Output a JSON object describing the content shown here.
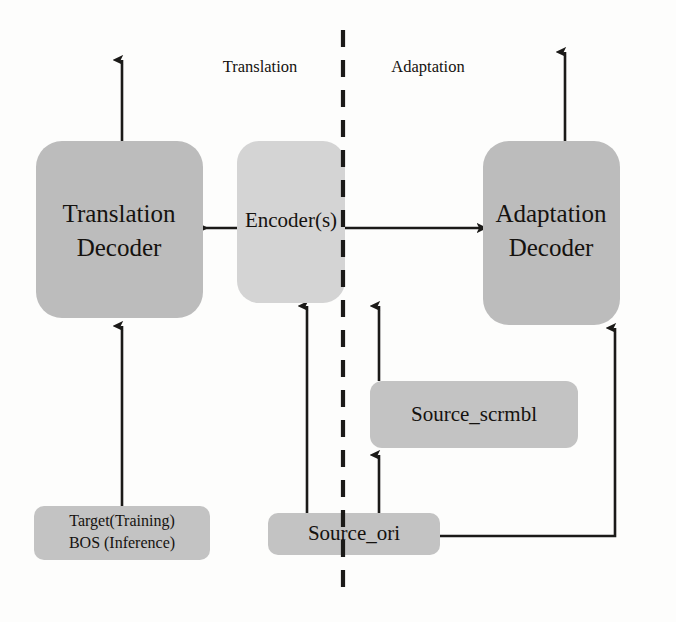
{
  "diagram": {
    "side_labels": {
      "left": "Translation",
      "right": "Adaptation"
    },
    "colors": {
      "decoder_fill": "#bcbcbc",
      "encoder_fill": "#d4d4d4",
      "input_fill": "#c3c3c3",
      "stroke": "#1b1a18",
      "text": "#15120f",
      "background": "#fdfdfc"
    },
    "nodes": {
      "translation_decoder": {
        "line1": "Translation",
        "line2": "Decoder"
      },
      "encoder": {
        "label": "Encoder(s)"
      },
      "adaptation_decoder": {
        "line1": "Adaptation",
        "line2": "Decoder"
      },
      "source_scrmbl": {
        "label": "Source_scrmbl"
      },
      "source_ori": {
        "label": "Source_ori"
      },
      "target_bos": {
        "line1": "Target(Training)",
        "line2": "BOS (Inference)"
      }
    }
  }
}
